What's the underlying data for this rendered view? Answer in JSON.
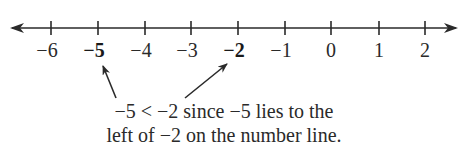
{
  "number_line": {
    "min_label": -6,
    "max_label": 2,
    "ticks": [
      {
        "value": "−6",
        "x": 51,
        "bold": false
      },
      {
        "value": "−5",
        "x": 98,
        "bold": true
      },
      {
        "value": "−4",
        "x": 145,
        "bold": false
      },
      {
        "value": "−3",
        "x": 191,
        "bold": false
      },
      {
        "value": "−2",
        "x": 238,
        "bold": true
      },
      {
        "value": "−1",
        "x": 285,
        "bold": false
      },
      {
        "value": "0",
        "x": 331,
        "bold": false
      },
      {
        "value": "1",
        "x": 379,
        "bold": false
      },
      {
        "value": "2",
        "x": 425,
        "bold": false
      }
    ],
    "highlighted": [
      "−5",
      "−2"
    ],
    "line_color": "#2a2a2a"
  },
  "annotation": {
    "line1": "−5 < −2 since −5 lies to the",
    "line2": "left of −2 on the number line."
  }
}
